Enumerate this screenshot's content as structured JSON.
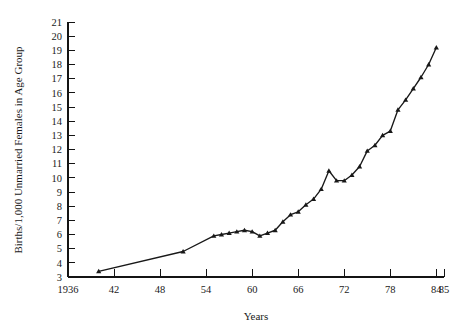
{
  "chart_data": {
    "type": "line",
    "title": "",
    "xlabel": "Years",
    "ylabel": "Births/1,000 Unmarried Females in Age Group",
    "xlim": [
      1936,
      1985
    ],
    "ylim": [
      3,
      21
    ],
    "grid": false,
    "legend": "none",
    "marker": "filled-triangle",
    "xtick_labels": [
      "1936",
      "42",
      "48",
      "54",
      "60",
      "66",
      "72",
      "78",
      "84",
      "85"
    ],
    "xtick_values": [
      1936,
      1942,
      1948,
      1954,
      1960,
      1966,
      1972,
      1978,
      1984,
      1985
    ],
    "ytick_labels": [
      "3",
      "4",
      "5",
      "6",
      "7",
      "8",
      "9",
      "10",
      "11",
      "12",
      "13",
      "14",
      "15",
      "16",
      "17",
      "18",
      "19",
      "20",
      "21"
    ],
    "ytick_values": [
      3,
      4,
      5,
      6,
      7,
      8,
      9,
      10,
      11,
      12,
      13,
      14,
      15,
      16,
      17,
      18,
      19,
      20,
      21
    ],
    "x": [
      1940,
      1951,
      1955,
      1956,
      1957,
      1958,
      1959,
      1960,
      1961,
      1962,
      1963,
      1964,
      1965,
      1966,
      1967,
      1968,
      1969,
      1970,
      1971,
      1972,
      1973,
      1974,
      1975,
      1976,
      1977,
      1978,
      1979,
      1980,
      1981,
      1982,
      1983,
      1984
    ],
    "values": [
      3.4,
      4.8,
      5.9,
      6.0,
      6.1,
      6.2,
      6.3,
      6.2,
      5.9,
      6.1,
      6.3,
      6.9,
      7.4,
      7.6,
      8.1,
      8.5,
      9.2,
      10.5,
      9.8,
      9.8,
      10.2,
      10.8,
      11.9,
      12.3,
      13.0,
      13.3,
      14.8,
      15.5,
      16.3,
      17.1,
      18.0,
      19.2
    ]
  }
}
